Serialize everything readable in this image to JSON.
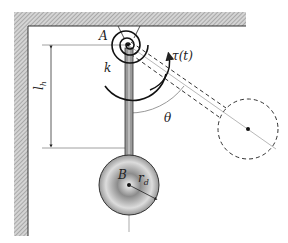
{
  "diagram": {
    "type": "pendulum-with-torsional-spring",
    "labels": {
      "pivot": "A",
      "spring": "k",
      "torque": "τ(t)",
      "angle": "θ",
      "length": "l",
      "length_sub": "h",
      "bob_center": "B",
      "radius": "r",
      "radius_sub": "d"
    },
    "colors": {
      "wall_fill": "#bdbdbd",
      "line": "#222222",
      "thin_line": "#777777",
      "bob_light": "#ffffff",
      "bob_dark": "#6e6e6e"
    }
  }
}
